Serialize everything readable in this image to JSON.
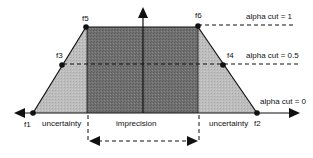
{
  "diagram": {
    "points": {
      "f1": "f1",
      "f2": "f2",
      "f3": "f3",
      "f4": "f4",
      "f5": "f5",
      "f6": "f6"
    },
    "alpha_cuts": {
      "top": "alpha cut = 1",
      "middle": "alpha cut = 0.5",
      "bottom": "alpha cut = 0"
    },
    "regions": {
      "left": "uncertainty",
      "center": "imprecision",
      "right": "uncertainty"
    },
    "colors": {
      "core_fill": "#6e6e6e",
      "support_fill": "#b9b9b9",
      "stroke": "#111111"
    }
  }
}
